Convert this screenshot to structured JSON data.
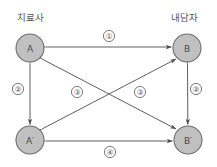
{
  "diagram": {
    "colors": {
      "node_fill": "#c0c0c0",
      "node_stroke": "#6e6e6e",
      "edge": "#4d4d4d",
      "background": "#ffffff",
      "text": "#4a4a4a"
    },
    "role_labels": [
      {
        "id": "role-therapist",
        "text": "치료사",
        "x": 30,
        "y": 17
      },
      {
        "id": "role-client",
        "text": "내담자",
        "x": 184,
        "y": 17
      }
    ],
    "nodes": [
      {
        "id": "node-a",
        "label": "A",
        "cx": 30,
        "cy": 48,
        "r": 14
      },
      {
        "id": "node-b",
        "label": "B",
        "cx": 187,
        "cy": 48,
        "r": 14
      },
      {
        "id": "node-a-prime",
        "label": "A′",
        "cx": 30,
        "cy": 140,
        "r": 14
      },
      {
        "id": "node-b-prime",
        "label": "B′",
        "cx": 188,
        "cy": 140,
        "r": 14
      }
    ],
    "edges": [
      {
        "id": "edge-a-b",
        "from": "A",
        "to": "B",
        "marker": "①",
        "style": "double-arrow"
      },
      {
        "id": "edge-a-aprime",
        "from": "A",
        "to": "A′",
        "marker": "②",
        "style": "double-arrow"
      },
      {
        "id": "edge-b-bprime",
        "from": "B",
        "to": "B′",
        "marker": "②",
        "style": "double-arrow"
      },
      {
        "id": "edge-a-bprime",
        "from": "A",
        "to": "B′",
        "marker": "③",
        "style": "double-arrow"
      },
      {
        "id": "edge-aprime-b",
        "from": "A′",
        "to": "B",
        "marker": "③",
        "style": "double-arrow"
      },
      {
        "id": "edge-aprime-bprime",
        "from": "A′",
        "to": "B′",
        "marker": "④",
        "style": "double-arrow"
      }
    ],
    "markers": [
      {
        "id": "marker-1",
        "text": "①",
        "x": 109,
        "y": 36
      },
      {
        "id": "marker-2-left",
        "text": "②",
        "x": 18,
        "y": 89
      },
      {
        "id": "marker-2-right",
        "text": "②",
        "x": 196,
        "y": 89
      },
      {
        "id": "marker-3-left",
        "text": "③",
        "x": 77,
        "y": 92
      },
      {
        "id": "marker-3-right",
        "text": "③",
        "x": 140,
        "y": 92
      },
      {
        "id": "marker-4",
        "text": "④",
        "x": 110,
        "y": 152
      }
    ]
  }
}
